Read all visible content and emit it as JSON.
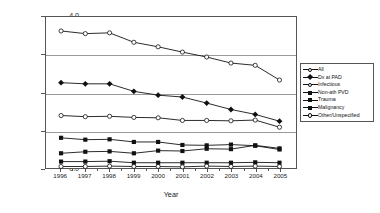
{
  "chart_data": {
    "type": "line",
    "title": "",
    "xlabel": "Year",
    "ylabel": "Incidence Rate (per 10,000 pop.)",
    "categories": [
      "1996",
      "1997",
      "1998",
      "1999",
      "2000",
      "2001",
      "2002",
      "2003",
      "2004",
      "2005"
    ],
    "x": [
      1996,
      1997,
      1998,
      1999,
      2000,
      2001,
      2002,
      2003,
      2004,
      2005
    ],
    "ylim": [
      0.0,
      4.0
    ],
    "yticks": [
      "0.0",
      "1.0",
      "2.0",
      "3.0",
      "4.0"
    ],
    "ytick_values": [
      0.0,
      1.0,
      2.0,
      3.0,
      4.0
    ],
    "grid": "horizontal",
    "gridlines_at": [
      1.0,
      2.0,
      3.0
    ],
    "legend_position": "right",
    "series": [
      {
        "name": "All",
        "marker": "open",
        "values": [
          3.63,
          3.56,
          3.58,
          3.33,
          3.21,
          3.07,
          2.94,
          2.78,
          2.72,
          2.33
        ]
      },
      {
        "name": "Dx at PAD",
        "marker": "diamond",
        "values": [
          2.26,
          2.23,
          2.23,
          2.03,
          1.93,
          1.88,
          1.72,
          1.55,
          1.42,
          1.24
        ]
      },
      {
        "name": "Infectious",
        "marker": "open",
        "values": [
          1.39,
          1.36,
          1.37,
          1.34,
          1.33,
          1.26,
          1.26,
          1.25,
          1.27,
          1.08
        ]
      },
      {
        "name": "Non-ath PVD",
        "marker": "filled",
        "values": [
          0.8,
          0.75,
          0.76,
          0.69,
          0.69,
          0.61,
          0.6,
          0.62,
          0.59,
          0.49
        ]
      },
      {
        "name": "Trauma",
        "marker": "filled",
        "values": [
          0.39,
          0.43,
          0.44,
          0.39,
          0.46,
          0.45,
          0.51,
          0.5,
          0.6,
          0.52
        ]
      },
      {
        "name": "Malignancy",
        "marker": "filled",
        "values": [
          0.17,
          0.17,
          0.18,
          0.14,
          0.14,
          0.14,
          0.14,
          0.14,
          0.15,
          0.14
        ]
      },
      {
        "name": "Other/Unspecified",
        "marker": "open",
        "values": [
          0.04,
          0.04,
          0.05,
          0.04,
          0.04,
          0.03,
          0.05,
          0.04,
          0.05,
          0.04
        ]
      }
    ]
  },
  "legend": {
    "entries": [
      {
        "label": "All"
      },
      {
        "label": "Dx at PAD"
      },
      {
        "label": "Infectious"
      },
      {
        "label": "Non-ath PVD"
      },
      {
        "label": "Trauma"
      },
      {
        "label": "Malignancy"
      },
      {
        "label": "Other/Unspecified"
      }
    ]
  },
  "colors": {
    "line": "#111111",
    "axis": "#555555",
    "grid": "#9a9a9a",
    "background": "#ffffff"
  }
}
